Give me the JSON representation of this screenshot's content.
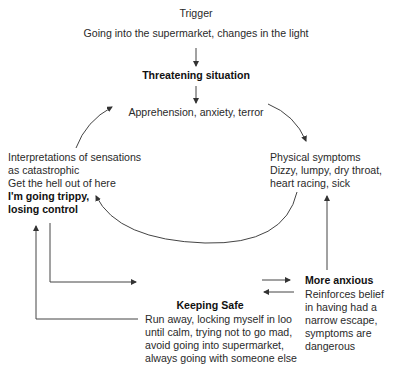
{
  "trigger": {
    "heading": "Trigger",
    "text": "Going into the supermarket, changes in the light"
  },
  "threat": {
    "heading": "Threatening situation",
    "text": "Apprehension, anxiety, terror"
  },
  "interpretations": {
    "lines": [
      "Interpretations of sensations",
      "as catastrophic",
      "Get the hell out of here"
    ],
    "bold_lines": [
      "I'm going trippy,",
      "losing control"
    ]
  },
  "physical": {
    "lines": [
      "Physical symptoms",
      "Dizzy, lumpy, dry throat,",
      "heart racing, sick"
    ]
  },
  "keeping_safe": {
    "heading": "Keeping Safe",
    "lines": [
      "Run away, locking myself in loo",
      "until calm, trying not to go mad,",
      "avoid going into supermarket,",
      "always going with someone else"
    ]
  },
  "more_anxious": {
    "heading": "More anxious",
    "lines": [
      "Reinforces belief",
      "in having had a",
      "narrow escape,",
      "symptoms are",
      "dangerous"
    ]
  },
  "colors": {
    "line": "#333333",
    "text": "#2a2a2a"
  }
}
